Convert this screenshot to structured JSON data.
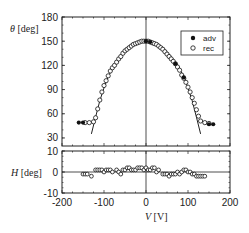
{
  "chart_data": [
    {
      "type": "scatter",
      "panel": "upper",
      "ylabel_symbol": "θ",
      "ylabel_unit": "[deg]",
      "xlabel": "",
      "xlim": [
        -200,
        200
      ],
      "ylim": [
        20,
        180
      ],
      "yticks": [
        30,
        60,
        90,
        120,
        150,
        180
      ],
      "xticks": [
        -200,
        -100,
        0,
        100,
        200
      ],
      "legend": {
        "position": "top-right",
        "entries": [
          {
            "label": "adv",
            "marker": "filled-circle"
          },
          {
            "label": "rec",
            "marker": "open-circle"
          }
        ]
      },
      "series": [
        {
          "name": "adv",
          "marker": "filled-circle",
          "x": [
            -160,
            -150,
            0,
            10,
            70,
            90,
            150,
            160
          ],
          "y": [
            49,
            49,
            150,
            149,
            122,
            105,
            47,
            47
          ]
        },
        {
          "name": "rec",
          "marker": "open-circle",
          "x": [
            -145,
            -135,
            -125,
            -120,
            -115,
            -110,
            -105,
            -100,
            -95,
            -90,
            -85,
            -80,
            -75,
            -70,
            -65,
            -60,
            -55,
            -50,
            -45,
            -40,
            -35,
            -30,
            -25,
            -20,
            -15,
            -10,
            -5,
            0,
            5,
            10,
            15,
            20,
            25,
            30,
            35,
            40,
            45,
            50,
            55,
            60,
            65,
            70,
            75,
            80,
            85,
            90,
            95,
            100,
            105,
            110,
            115,
            120,
            125,
            130,
            140,
            150
          ],
          "y": [
            49,
            49,
            50,
            55,
            66,
            77,
            87,
            95,
            101,
            107,
            113,
            117,
            120,
            124,
            128,
            131,
            135,
            138,
            140,
            142,
            144,
            146,
            147,
            148,
            149,
            150,
            150,
            150,
            150,
            149,
            148,
            147,
            146,
            144,
            142,
            140,
            137,
            134,
            131,
            128,
            125,
            122,
            118,
            114,
            108,
            104,
            99,
            93,
            87,
            80,
            73,
            65,
            57,
            51,
            49,
            48
          ]
        },
        {
          "name": "fit",
          "marker": "line",
          "x": [
            -130,
            -120,
            -110,
            -100,
            -90,
            -80,
            -70,
            -60,
            -50,
            -40,
            -30,
            -20,
            -10,
            0,
            10,
            20,
            30,
            40,
            50,
            60,
            70,
            80,
            90,
            100,
            110,
            120,
            130
          ],
          "y": [
            35,
            56,
            76,
            92,
            106,
            116,
            124,
            131,
            137,
            142,
            146,
            149,
            150,
            151,
            150,
            149,
            146,
            142,
            137,
            131,
            124,
            116,
            106,
            92,
            76,
            56,
            35
          ]
        }
      ]
    },
    {
      "type": "scatter",
      "panel": "lower",
      "ylabel_symbol": "H",
      "ylabel_unit": "[deg]",
      "xlabel_symbol": "V",
      "xlabel_unit": "[V]",
      "xlim": [
        -200,
        200
      ],
      "ylim": [
        -10,
        10
      ],
      "yticks": [
        -10,
        0,
        10
      ],
      "xticks": [
        -200,
        -100,
        0,
        100,
        200
      ],
      "xtick_labels": [
        "-200",
        "-100",
        "0",
        "100",
        "200"
      ],
      "series": [
        {
          "name": "H",
          "marker": "open-circle",
          "x": [
            -150,
            -145,
            -140,
            -130,
            -120,
            -115,
            -110,
            -105,
            -100,
            -95,
            -90,
            -85,
            -80,
            -70,
            -65,
            -60,
            -55,
            -50,
            -45,
            -40,
            -35,
            -30,
            -25,
            -20,
            -15,
            -10,
            -5,
            0,
            5,
            10,
            15,
            20,
            25,
            30,
            40,
            45,
            50,
            55,
            60,
            65,
            70,
            75,
            80,
            85,
            90,
            95,
            100,
            105,
            110,
            115,
            120,
            125,
            130,
            135,
            140
          ],
          "y": [
            -1,
            -1,
            -1,
            -2,
            1,
            1,
            1,
            1,
            0,
            1,
            1,
            1,
            0,
            1,
            0,
            -1,
            1,
            1,
            2,
            2,
            1,
            1,
            1,
            2,
            2,
            2,
            1,
            2,
            1,
            1,
            2,
            2,
            0,
            1,
            -1,
            -1,
            -1,
            -2,
            -1,
            -1,
            -1,
            0,
            -1,
            0,
            1,
            1,
            0,
            0,
            -1,
            -1,
            -2,
            -2,
            -2,
            -2,
            -2
          ]
        }
      ]
    }
  ]
}
